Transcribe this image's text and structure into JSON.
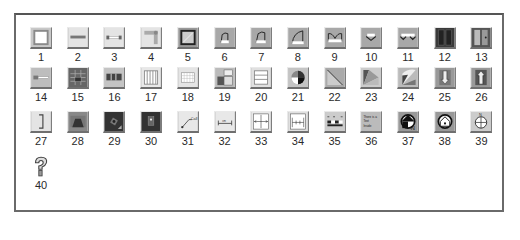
{
  "palette": {
    "frame": "#6a6a6a",
    "icon_bg": "#c8c8c8",
    "icon_bg_dark": "#9a9a9a",
    "label": "#2a2a2a"
  },
  "icons": [
    {
      "label": "1",
      "icon": "square-frame-icon"
    },
    {
      "label": "2",
      "icon": "horizontal-bar-icon"
    },
    {
      "label": "3",
      "icon": "bar-with-end-caps-icon"
    },
    {
      "label": "4",
      "icon": "corner-block-icon"
    },
    {
      "label": "5",
      "icon": "bold-square-icon"
    },
    {
      "label": "6",
      "icon": "small-arch-icon"
    },
    {
      "label": "7",
      "icon": "medium-arch-icon"
    },
    {
      "label": "8",
      "icon": "large-arch-icon"
    },
    {
      "label": "9",
      "icon": "double-arch-icon"
    },
    {
      "label": "10",
      "icon": "single-bracket-icon"
    },
    {
      "label": "11",
      "icon": "double-bracket-icon"
    },
    {
      "label": "12",
      "icon": "double-door-icon"
    },
    {
      "label": "13",
      "icon": "panel-door-icon"
    },
    {
      "label": "14",
      "icon": "key-bar-icon"
    },
    {
      "label": "15",
      "icon": "dark-grid-icon"
    },
    {
      "label": "16",
      "icon": "three-column-icon"
    },
    {
      "label": "17",
      "icon": "vertical-lines-icon"
    },
    {
      "label": "18",
      "icon": "fine-grid-icon"
    },
    {
      "label": "19",
      "icon": "layout-blocks-icon"
    },
    {
      "label": "20",
      "icon": "horizontal-stripes-icon"
    },
    {
      "label": "21",
      "icon": "pie-wheel-icon"
    },
    {
      "label": "22",
      "icon": "diagonal-split-icon"
    },
    {
      "label": "23",
      "icon": "fan-wedge-icon"
    },
    {
      "label": "24",
      "icon": "fan-arc-icon"
    },
    {
      "label": "25",
      "icon": "down-arrow-icon"
    },
    {
      "label": "26",
      "icon": "up-arrow-icon"
    },
    {
      "label": "27",
      "icon": "right-bracket-icon"
    },
    {
      "label": "28",
      "icon": "trapezoid-icon"
    },
    {
      "label": "29",
      "icon": "dark-tile-rotated-icon"
    },
    {
      "label": "30",
      "icon": "dark-tile-icon"
    },
    {
      "label": "31",
      "icon": "callout-line-icon"
    },
    {
      "label": "32",
      "icon": "dimension-icon"
    },
    {
      "label": "33",
      "icon": "cross-dimension-icon"
    },
    {
      "label": "34",
      "icon": "stair-dimension-icon"
    },
    {
      "label": "35",
      "icon": "scale-bar-icon"
    },
    {
      "label": "36",
      "icon": "text-block-icon"
    },
    {
      "label": "37",
      "icon": "north-arrow-house-icon"
    },
    {
      "label": "38",
      "icon": "house-circle-icon"
    },
    {
      "label": "39",
      "icon": "compass-icon"
    },
    {
      "label": "40",
      "icon": "question-mark-icon"
    }
  ],
  "icon_36_text": "There is a Text Inside"
}
